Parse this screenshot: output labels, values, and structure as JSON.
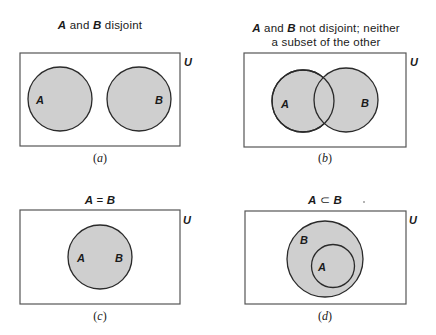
{
  "colors": {
    "set_fill": "#cfcfcf",
    "set_stroke": "#2a2a2a",
    "universe_stroke": "#555555",
    "text": "#1a1a1a"
  },
  "universe_label": "U",
  "panels": [
    {
      "id": "a",
      "title_parts": {
        "a": "A",
        "mid": " and ",
        "b": "B",
        "rest": " disjoint"
      },
      "title_line2": "",
      "caption_open": "(",
      "caption_letter": "a",
      "caption_close": ")",
      "relation": "disjoint",
      "set_labels": {
        "a": "A",
        "b": "B"
      }
    },
    {
      "id": "b",
      "title_parts": {
        "a": "A",
        "mid": " and ",
        "b": "B",
        "rest": " not disjoint; neither"
      },
      "title_line2": "a subset of the other",
      "caption_open": "(",
      "caption_letter": "b",
      "caption_close": ")",
      "relation": "overlapping",
      "set_labels": {
        "a": "A",
        "b": "B"
      }
    },
    {
      "id": "c",
      "title_parts": {
        "a": "A",
        "mid": " = ",
        "b": "B",
        "rest": ""
      },
      "title_line2": "",
      "caption_open": "(",
      "caption_letter": "c",
      "caption_close": ")",
      "relation": "equal",
      "set_labels": {
        "a": "A",
        "b": "B"
      }
    },
    {
      "id": "d",
      "title_parts": {
        "a": "A",
        "mid": " ⊂ ",
        "b": "B",
        "rest": ""
      },
      "title_line2": "",
      "caption_open": "(",
      "caption_letter": "d",
      "caption_close": ")",
      "relation": "subset",
      "set_labels": {
        "a": "A",
        "b": "B"
      }
    }
  ]
}
